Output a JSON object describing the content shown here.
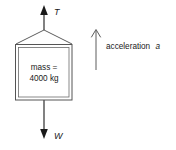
{
  "diagram": {
    "type": "free-body-diagram",
    "background_color": "#ffffff",
    "line_color": "#1a1a1a",
    "box_border_color": "#555555",
    "box_fill_color": "#ffffff",
    "body": {
      "label_line_1": "mass =",
      "label_line_2": "4000 kg",
      "mass_value": "4000",
      "mass_unit": "kg"
    },
    "forces": [
      {
        "name": "tension",
        "label": "T",
        "direction": "up",
        "arrowhead": "solid",
        "position": "top"
      },
      {
        "name": "weight",
        "label": "W",
        "direction": "down",
        "arrowhead": "solid",
        "position": "bottom"
      }
    ],
    "annotation": {
      "name": "acceleration",
      "text": "acceleration",
      "symbol": "a",
      "direction": "up",
      "arrowhead": "open",
      "position": "right"
    }
  }
}
